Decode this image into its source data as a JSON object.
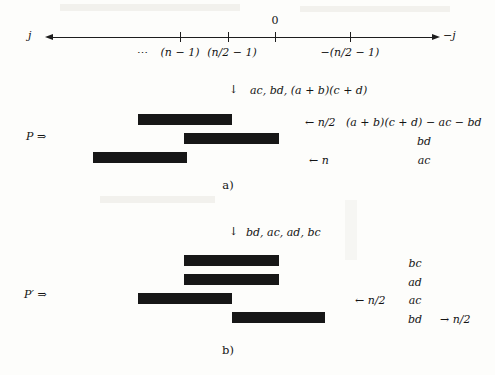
{
  "figure": {
    "caption_a": "a)",
    "caption_b": "b)"
  },
  "axis": {
    "left_label": "j",
    "right_label": "−j",
    "zero_label": "0",
    "ellipsis": "⋯",
    "ticks": [
      {
        "label": "(n − 1)",
        "x": 180
      },
      {
        "label": "(n/2 − 1)",
        "x": 228
      },
      {
        "label": "",
        "x": 275
      },
      {
        "label": "−(n/2 − 1)",
        "x": 350
      }
    ]
  },
  "panel_a": {
    "row_label": "P ⇒",
    "down_arrow": "↓",
    "input_list": "ac, bd, (a + b)(c + d)",
    "rows": [
      {
        "arrow_label": "← n/2",
        "expression": "(a + b)(c + d) − ac − bd"
      },
      {
        "arrow_label": "",
        "expression": "bd"
      },
      {
        "arrow_label": "← n",
        "expression": "ac"
      }
    ],
    "bars": [
      {
        "left": 138,
        "width": 94,
        "top": 114
      },
      {
        "left": 184,
        "width": 95,
        "top": 133
      },
      {
        "left": 93,
        "width": 94,
        "top": 152
      }
    ]
  },
  "panel_b": {
    "row_label": "P′ ⇒",
    "down_arrow": "↓",
    "input_list": "bd, ac, ad, bc",
    "rows": [
      {
        "arrow_label": "",
        "expression": "bc",
        "trailing": ""
      },
      {
        "arrow_label": "",
        "expression": "ad",
        "trailing": ""
      },
      {
        "arrow_label": "← n/2",
        "expression": "ac",
        "trailing": ""
      },
      {
        "arrow_label": "",
        "expression": "bd",
        "trailing": "→ n/2"
      }
    ],
    "bars": [
      {
        "left": 184,
        "width": 95,
        "top": 255
      },
      {
        "left": 184,
        "width": 95,
        "top": 274
      },
      {
        "left": 138,
        "width": 94,
        "top": 293
      },
      {
        "left": 232,
        "width": 93,
        "top": 312
      }
    ]
  },
  "colors": {
    "ink": "#171717",
    "paper": "#fdfdfb"
  }
}
